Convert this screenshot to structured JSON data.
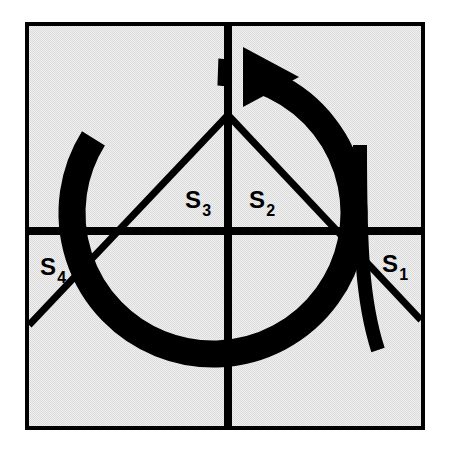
{
  "figure": {
    "name": "quadrant-diagram-with-rotation-arrow",
    "background_color": "#ffffff",
    "panel_fill": "#e9e9e9",
    "stroke_color": "#000000",
    "frame": {
      "x": 25,
      "y": 22,
      "width": 400,
      "height": 408,
      "border_width": 8
    },
    "axes": {
      "vertical_x": 228,
      "horizontal_y": 231,
      "line_width": 8
    },
    "vertex": {
      "x": 228,
      "y": 115
    },
    "diagonals": [
      {
        "name": "left-diagonal",
        "from_x": 228,
        "from_y": 115,
        "to_x": 29,
        "to_y": 325
      },
      {
        "name": "right-diagonal",
        "from_x": 228,
        "from_y": 115,
        "to_x": 421,
        "to_y": 320
      }
    ],
    "arc": {
      "name": "rotation-arc",
      "center_x": 213,
      "center_y": 213,
      "radius": 141,
      "stroke_width": 27,
      "start_angle_deg": 272,
      "sweep_deg": 300
    },
    "arrow_head": {
      "name": "arrow-head-right",
      "tip_x": 299,
      "tip_y": 77,
      "back_x": 243,
      "top_y": 47,
      "bottom_y": 107
    },
    "tail_stroke": {
      "name": "vertical-tail-stroke",
      "top_x": 360,
      "top_y": 145,
      "bottom_x": 378,
      "bottom_y": 350,
      "stroke_width": 14
    },
    "labels": [
      {
        "name": "label-s3",
        "base": "S",
        "subscript": "3",
        "x": 185,
        "y": 208
      },
      {
        "name": "label-s2",
        "base": "S",
        "subscript": "2",
        "x": 249,
        "y": 208
      },
      {
        "name": "label-s4",
        "base": "S",
        "subscript": "4",
        "x": 40,
        "y": 275
      },
      {
        "name": "label-s1",
        "base": "S",
        "subscript": "1",
        "x": 382,
        "y": 272
      }
    ],
    "label_font_size": 24,
    "subscript_font_size": 16
  },
  "chart_data": {
    "type": "diagram",
    "title": "",
    "regions": [
      "S1",
      "S2",
      "S3",
      "S4"
    ],
    "region_labels": [
      "S₁",
      "S₂",
      "S₃",
      "S₄"
    ],
    "annotations": [
      "S1",
      "S2",
      "S3",
      "S4"
    ],
    "grid": true,
    "legend": "none"
  }
}
